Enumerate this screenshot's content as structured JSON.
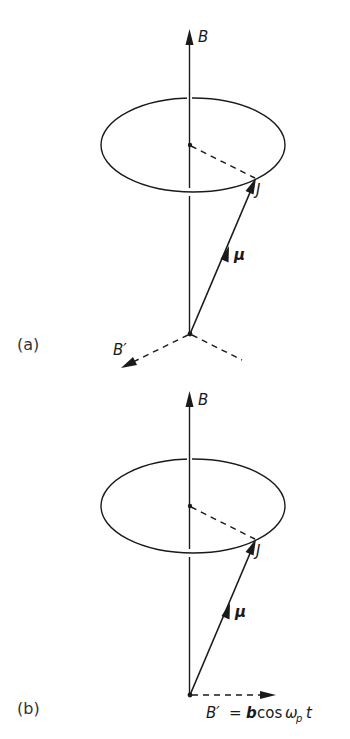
{
  "figure": {
    "panels": [
      {
        "id": "a",
        "panel_label": "(a)",
        "labels": {
          "field": "B",
          "angular_momentum": "J",
          "magnetic_moment": "μ",
          "perturbing_field": "B′"
        }
      },
      {
        "id": "b",
        "panel_label": "(b)",
        "labels": {
          "field": "B",
          "angular_momentum": "J",
          "magnetic_moment": "μ",
          "perturbing_field_lhs": "B′",
          "equals": "=",
          "amplitude": "b",
          "cos": "cos",
          "omega": "ω",
          "subscript": "p",
          "time": "t"
        }
      }
    ],
    "colors": {
      "line": "#1a1a1a",
      "background": "#ffffff"
    }
  }
}
